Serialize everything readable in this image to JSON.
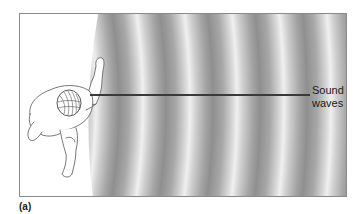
{
  "figure": {
    "panel_label": "(a)",
    "callout": {
      "line1": "Sound",
      "line2": "waves"
    },
    "colors": {
      "frame_border": "#8a8a8a",
      "wave_dark": "#8f8f8f",
      "wave_light": "#f0f0f0",
      "pointer_line": "#3a3a3a",
      "figure_stroke": "#555555"
    },
    "illustration": {
      "subject": "person-top-view-speaking-icon",
      "waves": "concentric-sound-wave-bands-icon"
    }
  }
}
